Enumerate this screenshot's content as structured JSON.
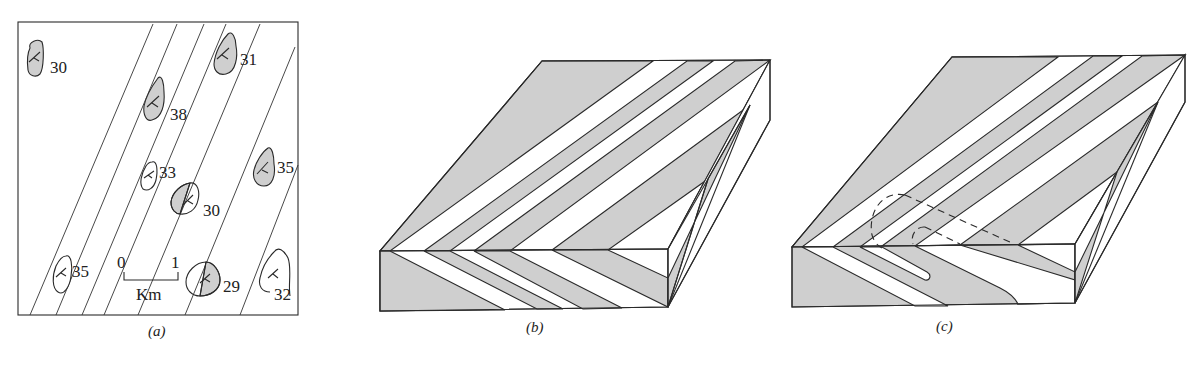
{
  "figure": {
    "panels": [
      {
        "id": "a",
        "caption": "(a)",
        "type": "geologic-map",
        "scale_bar": {
          "start_label": "0",
          "end_label": "1",
          "unit_label": "Km"
        },
        "outcrops": [
          {
            "dip": "30",
            "fill": "gray"
          },
          {
            "dip": "31",
            "fill": "gray"
          },
          {
            "dip": "38",
            "fill": "gray"
          },
          {
            "dip": "33",
            "fill": "white"
          },
          {
            "dip": "35",
            "fill": "gray"
          },
          {
            "dip": "30",
            "fill": "half"
          },
          {
            "dip": "35",
            "fill": "white"
          },
          {
            "dip": "29",
            "fill": "half"
          },
          {
            "dip": "32",
            "fill": "white"
          }
        ]
      },
      {
        "id": "b",
        "caption": "(b)",
        "type": "block-diagram-folded-layers"
      },
      {
        "id": "c",
        "caption": "(c)",
        "type": "block-diagram-folded-layers-with-closure"
      }
    ],
    "colors": {
      "layer_fill": "#cfcfcf",
      "line": "#2a2a2a",
      "background": "#ffffff"
    }
  }
}
